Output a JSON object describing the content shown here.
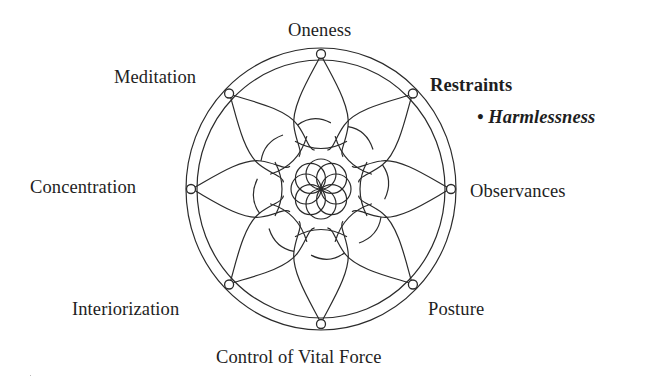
{
  "diagram": {
    "colors": {
      "line": "#2b2b2b",
      "text": "#1e1e1e",
      "background": "#ffffff"
    },
    "geometry": {
      "center": [
        321,
        189
      ],
      "outer_ring": {
        "rx": 135,
        "ry": 141
      },
      "inner_ring": {
        "rx": 124,
        "ry": 129
      },
      "node_ring": {
        "rx": 130,
        "ry": 135
      },
      "node_radius": 4.5,
      "rosette": {
        "circle_count": 8,
        "circle_radius": 15,
        "offset": 15
      },
      "petal_count": 8
    },
    "limbs": [
      {
        "position": "right",
        "label": "Restraints",
        "style": "bold",
        "angle_deg": -45,
        "sub_items": [
          {
            "bullet": "•",
            "label": "Harmlessness",
            "style": "bold-italic"
          }
        ]
      },
      {
        "position": "right",
        "label": "Observances",
        "style": "regular",
        "angle_deg": 0
      },
      {
        "position": "bottom-right",
        "label": "Posture",
        "style": "regular",
        "angle_deg": 45
      },
      {
        "position": "bottom",
        "label": "Control of Vital Force",
        "style": "regular",
        "angle_deg": 90
      },
      {
        "position": "bottom-left",
        "label": "Interiorization",
        "style": "regular",
        "angle_deg": 135
      },
      {
        "position": "left",
        "label": "Concentration",
        "style": "regular",
        "angle_deg": 180
      },
      {
        "position": "top-left",
        "label": "Meditation",
        "style": "regular",
        "angle_deg": 225
      },
      {
        "position": "top",
        "label": "Oneness",
        "style": "regular",
        "angle_deg": 270
      }
    ],
    "labels": {
      "oneness": "Oneness",
      "meditation": "Meditation",
      "restraints": "Restraints",
      "harmlessness": "• Harmlessness",
      "concentration": "Concentration",
      "observances": "Observances",
      "interiorization": "Interiorization",
      "posture": "Posture",
      "control_of_vital_force": "Control of Vital Force"
    }
  }
}
